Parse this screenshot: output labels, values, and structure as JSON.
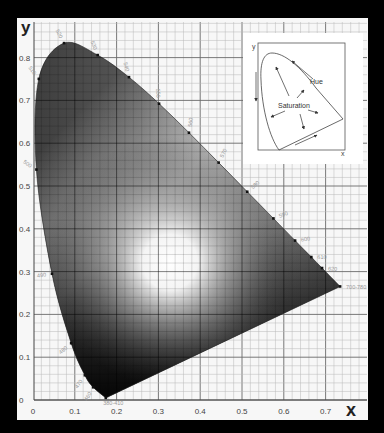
{
  "chart_data": {
    "type": "scatter",
    "xlabel": "x",
    "ylabel": "y",
    "xlim": [
      0,
      0.8
    ],
    "ylim": [
      0,
      0.85
    ],
    "x_ticks": [
      "0",
      "0.1",
      "0.2",
      "0.3",
      "0.4",
      "0.5",
      "0.6",
      "0.7"
    ],
    "y_ticks": [
      "0",
      "0.1",
      "0.2",
      "0.3",
      "0.4",
      "0.5",
      "0.6",
      "0.7",
      "0.8"
    ],
    "grid": {
      "major_step": 0.1,
      "minor_step": 0.02
    },
    "spectral_locus": [
      {
        "label": "380-410",
        "x": 0.1741,
        "y": 0.005
      },
      {
        "label": "460",
        "x": 0.144,
        "y": 0.0297
      },
      {
        "label": "470",
        "x": 0.1241,
        "y": 0.0578
      },
      {
        "label": "480",
        "x": 0.0913,
        "y": 0.1327
      },
      {
        "label": "490",
        "x": 0.0454,
        "y": 0.295
      },
      {
        "label": "500",
        "x": 0.0082,
        "y": 0.5384
      },
      {
        "label": "510",
        "x": 0.0139,
        "y": 0.7502
      },
      {
        "label": "520",
        "x": 0.0743,
        "y": 0.8338
      },
      {
        "label": "530",
        "x": 0.1547,
        "y": 0.8059
      },
      {
        "label": "540",
        "x": 0.2296,
        "y": 0.7543
      },
      {
        "label": "550",
        "x": 0.3016,
        "y": 0.6923
      },
      {
        "label": "560",
        "x": 0.3731,
        "y": 0.6245
      },
      {
        "label": "570",
        "x": 0.4441,
        "y": 0.5547
      },
      {
        "label": "580",
        "x": 0.5125,
        "y": 0.4866
      },
      {
        "label": "590",
        "x": 0.5752,
        "y": 0.4242
      },
      {
        "label": "600",
        "x": 0.627,
        "y": 0.3725
      },
      {
        "label": "610",
        "x": 0.6658,
        "y": 0.334
      },
      {
        "label": "620",
        "x": 0.6915,
        "y": 0.3083
      },
      {
        "label": "700-780",
        "x": 0.7347,
        "y": 0.2653
      }
    ],
    "white_point": {
      "x": 0.33,
      "y": 0.33
    },
    "inset": {
      "xlabel": "x",
      "ylabel": "y",
      "annotations": [
        "Hue",
        "Saturation"
      ]
    }
  },
  "labels": {
    "x_axis": "x",
    "y_axis": "y",
    "inset_hue": "Hue",
    "inset_saturation": "Saturation",
    "inset_x": "x",
    "inset_y": "y"
  }
}
